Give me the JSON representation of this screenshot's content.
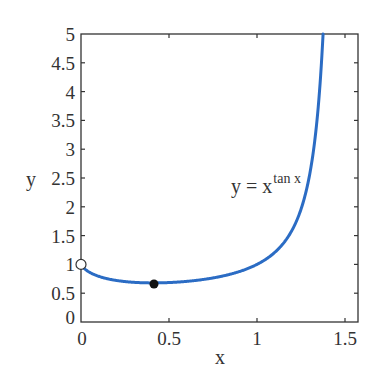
{
  "chart_data": {
    "type": "line",
    "title": "",
    "xlabel": "x",
    "ylabel": "y",
    "xlim": [
      0,
      1.5708
    ],
    "ylim": [
      0,
      5
    ],
    "grid": false,
    "legend": null,
    "x_ticks": [
      "0",
      "0.5",
      "1",
      "1.5"
    ],
    "y_ticks": [
      "0",
      "0.5",
      "1",
      "1.5",
      "2",
      "2.5",
      "3",
      "3.5",
      "4",
      "4.5",
      "5"
    ],
    "series": [
      {
        "name": "y = x^tan x",
        "function": "x^tan(x)",
        "color": "#2b6cc4",
        "x": [
          0.0,
          0.05,
          0.1,
          0.2,
          0.3,
          0.4,
          0.5,
          0.6,
          0.7,
          0.8,
          0.9,
          1.0,
          1.1,
          1.2,
          1.25,
          1.3,
          1.35,
          1.375
        ],
        "y": [
          1.0,
          0.86,
          0.79,
          0.72,
          0.69,
          0.68,
          0.68,
          0.7,
          0.74,
          0.8,
          0.89,
          1.0,
          1.19,
          1.58,
          1.91,
          2.37,
          3.35,
          5.0
        ]
      }
    ],
    "annotations": [
      {
        "type": "open-circle",
        "x": 0,
        "y": 1,
        "meaning": "excluded endpoint (limit as x→0+)"
      },
      {
        "type": "filled-circle",
        "x": 0.415,
        "y": 0.66,
        "meaning": "minimum point"
      },
      {
        "type": "text",
        "text": "y = x^tan x",
        "x": 1.05,
        "y": 2.45
      }
    ]
  },
  "labels": {
    "xlabel": "x",
    "ylabel": "y",
    "curve_label_base": "y = x",
    "curve_label_exp": "tan x"
  },
  "colors": {
    "curve": "#2b6cc4",
    "axis": "#333333"
  }
}
